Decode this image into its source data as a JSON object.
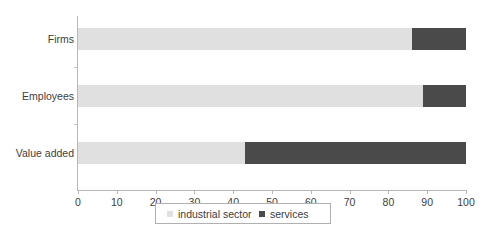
{
  "chart_data": {
    "type": "bar",
    "orientation": "horizontal",
    "stacked": true,
    "title": "",
    "subtitle": "",
    "xlabel": "",
    "ylabel": "",
    "categories": [
      "Firms",
      "Employees",
      "Value added"
    ],
    "series": [
      {
        "name": "industrial sector",
        "color": "#e0e0e0",
        "values": [
          86,
          89,
          43
        ]
      },
      {
        "name": "services",
        "color": "#4a4a4a",
        "values": [
          14,
          11,
          57
        ]
      }
    ],
    "xlim": [
      0,
      100
    ],
    "xticks": [
      0,
      10,
      20,
      30,
      40,
      50,
      60,
      70,
      80,
      90,
      100
    ],
    "xtick_labels": [
      "0",
      "10",
      "20",
      "30",
      "40",
      "50",
      "60",
      "70",
      "80",
      "90",
      "100"
    ],
    "grid": false,
    "legend_position": "bottom",
    "legend_entries": [
      "industrial sector",
      "services"
    ],
    "axis_color": "#b8b8b8",
    "background_color": "#ffffff"
  },
  "legend": {
    "items": [
      {
        "label": "industrial sector",
        "color": "#e0e0e0"
      },
      {
        "label": "services",
        "color": "#4a4a4a"
      }
    ]
  }
}
